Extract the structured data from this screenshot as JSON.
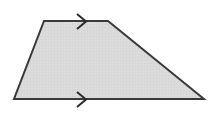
{
  "figure": {
    "name": "trapezoid-with-parallel-marks",
    "type": "geometric-shape",
    "shape_name": "trapezoid",
    "caption": "Trapezoid with single arrow marks on the top and bottom sides indicating parallel sides",
    "canvas": {
      "width": 215,
      "height": 113
    },
    "colors": {
      "background": "#ffffff",
      "fill": "#dcdcdc",
      "grid": "#cfcfcf",
      "stroke": "#3a3a3a",
      "mark": "#2b2b2b"
    },
    "stroke_width": 2,
    "mark_stroke_width": 2,
    "vertices": [
      {
        "label": "top-left",
        "x": 44,
        "y": 21
      },
      {
        "label": "top-right",
        "x": 108,
        "y": 21
      },
      {
        "label": "bottom-right",
        "x": 204,
        "y": 99
      },
      {
        "label": "bottom-left",
        "x": 14,
        "y": 99
      }
    ],
    "polygon_points": "44,21 108,21 204,99 14,99",
    "sides": [
      {
        "name": "top-side",
        "from": "top-left",
        "to": "top-right",
        "marks": 1,
        "parallel_group": "A"
      },
      {
        "name": "right-side",
        "from": "top-right",
        "to": "bottom-right",
        "marks": 0,
        "parallel_group": ""
      },
      {
        "name": "bottom-side",
        "from": "bottom-right",
        "to": "bottom-left",
        "marks": 1,
        "parallel_group": "A"
      },
      {
        "name": "left-side",
        "from": "bottom-left",
        "to": "top-left",
        "marks": 0,
        "parallel_group": ""
      }
    ],
    "marks": [
      {
        "name": "top-parallel-arrow",
        "side": "top-side",
        "shape": "chevron-right",
        "points": "77,14 86,21.5 77,29",
        "center_x": 81,
        "center_y": 21
      },
      {
        "name": "bottom-parallel-arrow",
        "side": "bottom-side",
        "shape": "chevron-right",
        "points": "77,92 86,99.5 77,107",
        "center_x": 81,
        "center_y": 99
      }
    ]
  }
}
